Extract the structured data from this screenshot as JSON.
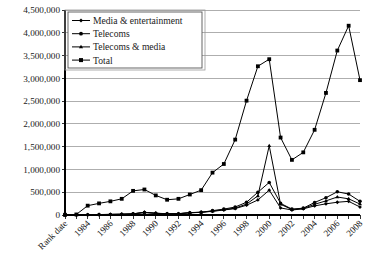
{
  "chart_data": {
    "type": "line",
    "title": "",
    "xlabel": "Rank date",
    "ylabel": "",
    "ylim": [
      0,
      4500000
    ],
    "grid": true,
    "legend_position": "top-left",
    "x_axis_first_label": "Rank date",
    "y_ticks": [
      "0",
      "500,000",
      "1,000,000",
      "1,500,000",
      "2,000,000",
      "2,500,000",
      "3,000,000",
      "3,500,000",
      "4,000,000",
      "4,500,000"
    ],
    "y_tick_values": [
      0,
      500000,
      1000000,
      1500000,
      2000000,
      2500000,
      3000000,
      3500000,
      4000000,
      4500000
    ],
    "x": [
      1982,
      1983,
      1984,
      1985,
      1986,
      1987,
      1988,
      1989,
      1990,
      1991,
      1992,
      1993,
      1994,
      1995,
      1996,
      1997,
      1998,
      1999,
      2000,
      2001,
      2002,
      2003,
      2004,
      2005,
      2006,
      2007,
      2008
    ],
    "x_tick_labels": [
      "Rank date",
      "",
      "1984",
      "",
      "1986",
      "",
      "1988",
      "",
      "1990",
      "",
      "1992",
      "",
      "1994",
      "",
      "1996",
      "",
      "1998",
      "",
      "2000",
      "",
      "2002",
      "",
      "2004",
      "",
      "2006",
      "",
      "2008"
    ],
    "series": [
      {
        "name": "Media & entertainment",
        "marker": "diamond",
        "values": [
          2000,
          4000,
          8000,
          10000,
          14000,
          18000,
          26000,
          60000,
          40000,
          28000,
          30000,
          52000,
          62000,
          80000,
          110000,
          140000,
          215000,
          330000,
          545000,
          155000,
          110000,
          135000,
          200000,
          245000,
          280000,
          300000,
          175000
        ]
      },
      {
        "name": "Telecoms",
        "marker": "circle",
        "values": [
          1000,
          3000,
          6000,
          9000,
          12000,
          16000,
          24000,
          55000,
          36000,
          25000,
          27000,
          48000,
          58000,
          95000,
          130000,
          175000,
          280000,
          500000,
          715000,
          255000,
          130000,
          150000,
          275000,
          380000,
          510000,
          460000,
          300000
        ]
      },
      {
        "name": "Telecoms & media",
        "marker": "triangle",
        "values": [
          1500,
          3500,
          7000,
          9500,
          13000,
          17000,
          25000,
          57000,
          38000,
          26000,
          28000,
          50000,
          60000,
          85000,
          118000,
          150000,
          240000,
          420000,
          1520000,
          235000,
          120000,
          142000,
          235000,
          310000,
          395000,
          355000,
          240000
        ]
      },
      {
        "name": "Total",
        "marker": "square",
        "values": [
          5000,
          12000,
          205000,
          255000,
          300000,
          355000,
          530000,
          560000,
          430000,
          335000,
          355000,
          450000,
          545000,
          930000,
          1120000,
          1655000,
          2510000,
          3265000,
          3420000,
          1700000,
          1210000,
          1375000,
          1870000,
          2680000,
          3610000,
          4155000,
          2960000
        ]
      }
    ]
  },
  "legend": {
    "items": [
      {
        "label": "Media & entertainment",
        "marker": "diamond"
      },
      {
        "label": "Telecoms",
        "marker": "circle"
      },
      {
        "label": "Telecoms & media",
        "marker": "triangle"
      },
      {
        "label": "Total",
        "marker": "square"
      }
    ]
  },
  "colors": {
    "series": "#000000",
    "grid": "#8c8c8c",
    "axis": "#000000",
    "background": "#ffffff",
    "text": "#1a1a1a"
  }
}
